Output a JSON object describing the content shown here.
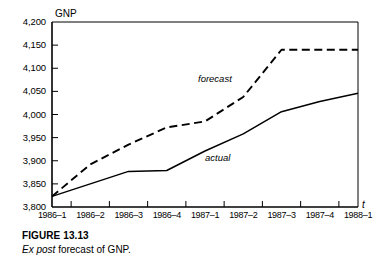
{
  "figure": {
    "caption_title": "FIGURE 13.13",
    "caption_emphasis": "Ex post",
    "caption_rest": " forecast of GNP."
  },
  "chart_data": {
    "type": "line",
    "title": "",
    "ylabel": "GNP",
    "xlabel": "t",
    "categories": [
      "1986–1",
      "1986–2",
      "1986–3",
      "1986–4",
      "1987–1",
      "1987–2",
      "1987–3",
      "1987–4",
      "1988–1"
    ],
    "ylim": [
      3800,
      4200
    ],
    "yticks": [
      3800,
      3850,
      3900,
      3950,
      4000,
      4050,
      4100,
      4150,
      4200
    ],
    "ytick_labels": [
      "3,800",
      "3,850",
      "3,900",
      "3,950",
      "4,000",
      "4,050",
      "4,100",
      "4,150",
      "4,200"
    ],
    "grid": false,
    "legend": "inline-annotations",
    "series": [
      {
        "name": "actual",
        "style": "solid",
        "color": "#000000",
        "values": [
          3823,
          3850,
          3877,
          3879,
          3921,
          3958,
          4006,
          4028,
          4046
        ]
      },
      {
        "name": "forecast",
        "style": "dashed",
        "color": "#000000",
        "values": [
          3823,
          3892,
          3935,
          3972,
          3985,
          4038,
          4140,
          4140,
          4140
        ]
      }
    ],
    "annotations": [
      {
        "text": "forecast",
        "series": "forecast"
      },
      {
        "text": "actual",
        "series": "actual"
      }
    ]
  }
}
